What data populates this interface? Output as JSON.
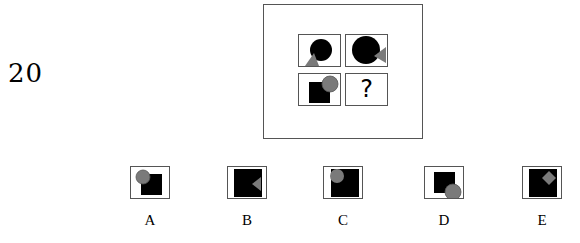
{
  "question": {
    "number": "20"
  },
  "matrix": {
    "cells": [
      {
        "id": "r1c1",
        "shapes": [
          "black-circle",
          "gray-triangle-bottom-left"
        ]
      },
      {
        "id": "r1c2",
        "shapes": [
          "black-circle-large",
          "gray-triangle-right"
        ]
      },
      {
        "id": "r2c1",
        "shapes": [
          "black-square",
          "gray-circle-top-right"
        ]
      },
      {
        "id": "r2c2",
        "text": "?"
      }
    ]
  },
  "options": [
    {
      "label": "A",
      "shapes": [
        "black-square",
        "gray-circle-top-left"
      ]
    },
    {
      "label": "B",
      "shapes": [
        "black-square-large",
        "gray-triangle-right"
      ]
    },
    {
      "label": "C",
      "shapes": [
        "black-square-large",
        "gray-circle-top-left"
      ]
    },
    {
      "label": "D",
      "shapes": [
        "black-square",
        "gray-circle-bottom-right"
      ]
    },
    {
      "label": "E",
      "shapes": [
        "black-square-large",
        "gray-diamond-top-right"
      ]
    }
  ],
  "colors": {
    "fill_dark": "#000000",
    "fill_gray": "#7a7a7a",
    "border": "#555555"
  }
}
